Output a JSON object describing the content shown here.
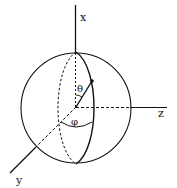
{
  "diagram": {
    "axes": {
      "x_label": "x",
      "y_label": "y",
      "z_label": "z"
    },
    "angles": {
      "polar_label": "θ",
      "azimuth_label": "φ"
    },
    "colors": {
      "stroke": "#111111",
      "background": "#ffffff"
    }
  }
}
